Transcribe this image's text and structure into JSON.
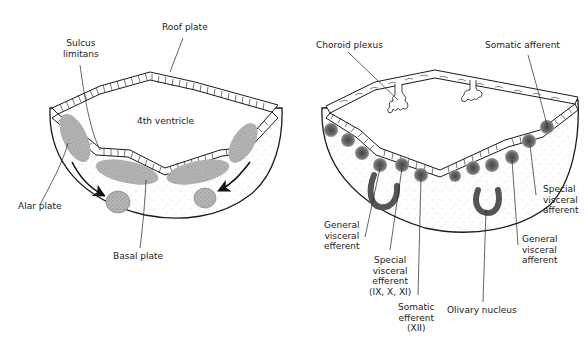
{
  "diagram": {
    "type": "anatomical cross-section",
    "panels": [
      {
        "id": "left",
        "labels": {
          "roof_plate": "Roof plate",
          "sulcus_limitans": "Sulcus\nlimitans",
          "ventricle": "4th ventricle",
          "alar_plate": "Alar plate",
          "basal_plate": "Basal plate"
        }
      },
      {
        "id": "right",
        "labels": {
          "choroid_plexus": "Choroid plexus",
          "somatic_afferent": "Somatic afferent",
          "special_visceral_afferent": "Special\nvisceral\nafferent",
          "general_visceral_efferent_left": "General\nvisceral\nefferent",
          "special_visceral_efferent": "Special\nvisceral\nefferent\n(IX, X, XI)",
          "somatic_efferent": "Somatic\nefferent\n(XII)",
          "olivary_nucleus": "Olivary nucleus",
          "general_visceral_afferent": "General\nvisceral\nafferent"
        }
      }
    ],
    "colors": {
      "stroke": "#1a1a1a",
      "plate_fill": "#b0b0b0",
      "nucleus_fill": "#6a6a6a",
      "stipple": "#999999",
      "background": "#ffffff"
    }
  }
}
